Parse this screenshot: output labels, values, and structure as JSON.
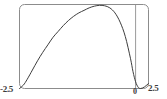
{
  "figure": {
    "name": "plot-thumbnail",
    "background_color": "#ffffff",
    "frame_color": "#8c8c8c",
    "curve_color": "#3d3d3d",
    "axis_color": "#9a9a9a",
    "label_color": "#3a3a3a"
  },
  "labels": {
    "x_min": "-2.5",
    "x_zero": "0",
    "x_max": "2.5"
  },
  "chart_data": {
    "type": "line",
    "title": "",
    "subtitle": "",
    "xlabel": "",
    "ylabel": "",
    "xlim": [
      -2.5,
      2.5
    ],
    "ylim": [
      0,
      1
    ],
    "grid": false,
    "legend": null,
    "xticks": [
      -2.5,
      0,
      2.5
    ],
    "xtick_labels": [
      "-2.5",
      "0",
      "2.5"
    ],
    "yticks": [],
    "ytick_labels": [],
    "annotations": [],
    "axis_lines": [
      {
        "name": "zero-vertical-line",
        "orientation": "vertical",
        "x": 2.0
      }
    ],
    "series": [
      {
        "name": "curve",
        "color": "#3d3d3d",
        "x": [
          -2.5,
          -2.35,
          -2.2,
          -2.0,
          -1.8,
          -1.6,
          -1.4,
          -1.2,
          -1.0,
          -0.8,
          -0.6,
          -0.4,
          -0.2,
          0.0,
          0.2,
          0.4,
          0.6,
          0.8,
          1.0,
          1.2,
          1.4,
          1.6,
          1.8,
          1.9,
          2.0,
          2.1,
          2.2,
          2.35,
          2.5
        ],
        "y": [
          0.0,
          0.04,
          0.11,
          0.22,
          0.33,
          0.43,
          0.52,
          0.61,
          0.68,
          0.75,
          0.81,
          0.86,
          0.9,
          0.93,
          0.96,
          0.98,
          0.99,
          0.985,
          0.96,
          0.9,
          0.79,
          0.62,
          0.36,
          0.2,
          0.08,
          0.015,
          0.0,
          0.02,
          0.06
        ]
      }
    ]
  }
}
